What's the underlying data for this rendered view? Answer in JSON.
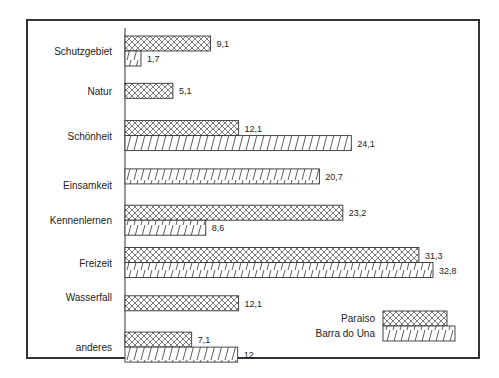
{
  "chart_data": {
    "type": "bar",
    "orientation": "horizontal",
    "title": "",
    "xlabel": "",
    "ylabel": "",
    "categories": [
      "Schutzgebiet",
      "Natur",
      "Schönheit",
      "Einsamkeit",
      "Kennenlernen",
      "Freizeit",
      "Wasserfall",
      "anderes"
    ],
    "series": [
      {
        "name": "Paraiso",
        "pattern": "crosshatch",
        "values": [
          9.1,
          5.1,
          12.1,
          null,
          23.2,
          31.3,
          12.1,
          7.1
        ],
        "labels": [
          "9,1",
          "5,1",
          "12,1",
          "",
          "23,2",
          "31,3",
          "12,1",
          "7,1"
        ]
      },
      {
        "name": "Barra do Una",
        "pattern": "diagonal",
        "values": [
          1.7,
          null,
          24.1,
          20.7,
          8.6,
          32.8,
          null,
          12
        ],
        "labels": [
          "1,7",
          "",
          "24,1",
          "20,7",
          "8,6",
          "32,8",
          "",
          "12"
        ]
      }
    ],
    "xlim": [
      0,
      35
    ],
    "grid": false,
    "axis_ticks": false,
    "legend_position": "bottom-right"
  },
  "legend": {
    "items": [
      {
        "label": "Paraiso",
        "pattern": "crosshatch"
      },
      {
        "label": "Barra do Una",
        "pattern": "diagonal"
      }
    ]
  },
  "colors": {
    "ink": "#333333",
    "background": "#ffffff"
  }
}
